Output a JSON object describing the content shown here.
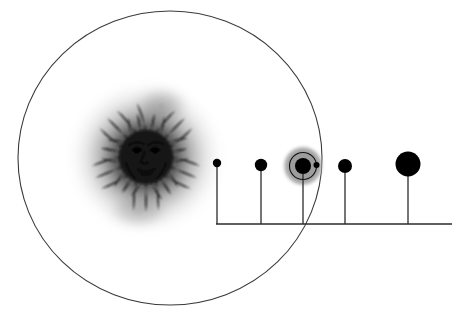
{
  "diagram": {
    "title": "Solar system schematic with sun and five planets",
    "background_color": "#ffffff",
    "width": 476,
    "height": 324
  },
  "orbit_circle": {
    "name": "large-orbit-ellipse",
    "center_x": 170,
    "center_y": 158,
    "radius_x": 152,
    "radius_y": 147,
    "stroke_color": "#3a3a3a",
    "stroke_width": 1.1,
    "fill": "none"
  },
  "sun": {
    "label": "sun",
    "center_x": 146,
    "center_y": 157,
    "glow_radius": 84,
    "disc_radius": 27,
    "ray_count": 32,
    "ray_inner_radius": 27,
    "ray_outer_radius": 55,
    "face": {
      "eyes": 2,
      "nose": 1,
      "mouth": 1
    },
    "color": "#151515",
    "glow_color": "#2a2a2a"
  },
  "baseline": {
    "name": "baseline-axis",
    "x_start": 216,
    "x_end": 452,
    "y": 224,
    "stroke_color": "#2b2b2b",
    "stroke_width": 1.4
  },
  "planets": [
    {
      "index": 1,
      "name": "planet-1",
      "cx": 217,
      "cy": 163,
      "radius": 4.2,
      "stem_top": 167,
      "stem_bottom": 224,
      "color": "#000000",
      "has_moon": false,
      "has_halo": false
    },
    {
      "index": 2,
      "name": "planet-2",
      "cx": 261,
      "cy": 165,
      "radius": 6.2,
      "stem_top": 171,
      "stem_bottom": 224,
      "color": "#000000",
      "has_moon": false,
      "has_halo": false
    },
    {
      "index": 3,
      "name": "planet-3-earth",
      "cx": 303,
      "cy": 166,
      "radius": 8.0,
      "stem_top": 174,
      "stem_bottom": 224,
      "color": "#000000",
      "has_moon": true,
      "has_halo": true,
      "halo_radius": 19.5,
      "halo_color": "#9c9c9c",
      "moon_orbit_radius": 13.5,
      "moon_orbit_stroke": "#111111",
      "moon_cx": 316.5,
      "moon_cy": 165,
      "moon_radius": 3.0
    },
    {
      "index": 4,
      "name": "planet-4",
      "cx": 345,
      "cy": 166,
      "radius": 7.0,
      "stem_top": 173,
      "stem_bottom": 224,
      "color": "#000000",
      "has_moon": false,
      "has_halo": false
    },
    {
      "index": 5,
      "name": "planet-5",
      "cx": 408,
      "cy": 164,
      "radius": 12.5,
      "stem_top": 176,
      "stem_bottom": 224,
      "color": "#000000",
      "has_moon": false,
      "has_halo": false
    }
  ]
}
